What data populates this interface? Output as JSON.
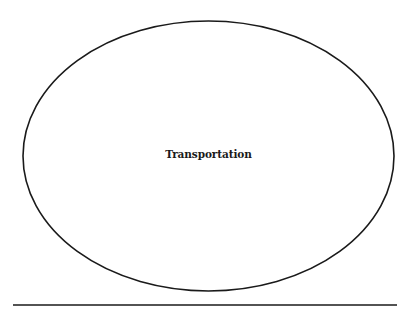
{
  "diagram": {
    "type": "ellipse-concept",
    "shapes": [
      {
        "kind": "ellipse",
        "label": "Transportation",
        "cx": 208.5,
        "cy": 156,
        "rx": 185.5,
        "ry": 135,
        "stroke": "#1a1a1a",
        "fill": "#ffffff"
      }
    ],
    "rule": {
      "x1": 13,
      "x2": 397,
      "y": 305,
      "stroke": "#1a1a1a"
    }
  }
}
